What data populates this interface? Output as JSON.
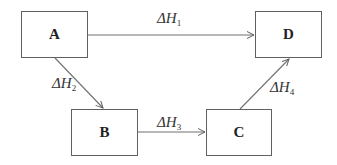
{
  "diagram": {
    "type": "enthalpy-cycle",
    "nodes": [
      {
        "id": "A",
        "label": "A"
      },
      {
        "id": "B",
        "label": "B"
      },
      {
        "id": "C",
        "label": "C"
      },
      {
        "id": "D",
        "label": "D"
      }
    ],
    "edges": [
      {
        "from": "A",
        "to": "D",
        "symbol": "ΔH",
        "index": "1"
      },
      {
        "from": "A",
        "to": "B",
        "symbol": "ΔH",
        "index": "2"
      },
      {
        "from": "B",
        "to": "C",
        "symbol": "ΔH",
        "index": "3"
      },
      {
        "from": "C",
        "to": "D",
        "symbol": "ΔH",
        "index": "4"
      }
    ],
    "colors": {
      "line": "#606060",
      "text": "#222222",
      "background": "#ffffff"
    }
  }
}
